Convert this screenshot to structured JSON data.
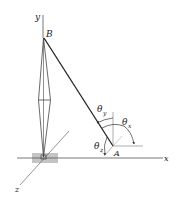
{
  "diagram": {
    "axes": {
      "x": "x",
      "y": "y",
      "z": "z"
    },
    "points": {
      "top": "B",
      "anchor": "A"
    },
    "angles": {
      "theta_x": {
        "symbol": "θ",
        "sub": "x"
      },
      "theta_y": {
        "symbol": "θ",
        "sub": "y"
      },
      "theta_z": {
        "symbol": "θ",
        "sub": "z"
      }
    },
    "colors": {
      "line": "#333333",
      "ground": "#9a9a9a",
      "light": "#888888"
    }
  }
}
